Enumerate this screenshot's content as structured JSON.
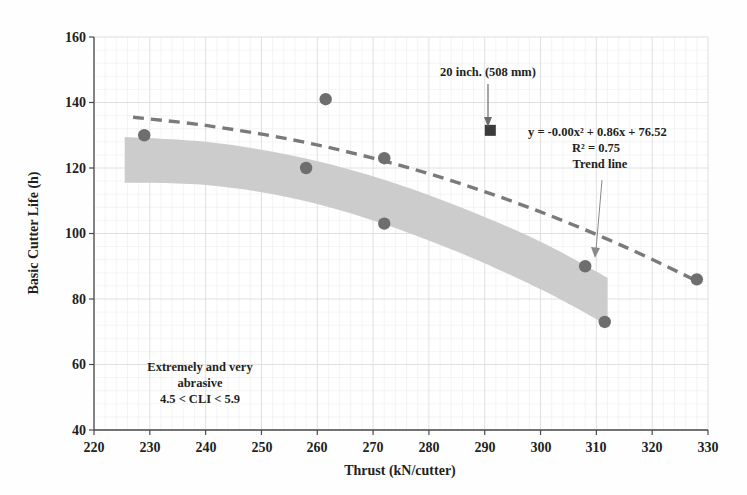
{
  "chart_data": {
    "type": "scatter",
    "title": "",
    "xlabel": "Thrust  (kN/cutter)",
    "ylabel": "Basic Cutter Life (h)",
    "xlim": [
      220,
      330
    ],
    "ylim": [
      40,
      160
    ],
    "xticks": [
      220,
      230,
      240,
      250,
      260,
      270,
      280,
      290,
      300,
      310,
      320,
      330
    ],
    "xtick_labels": [
      "220",
      "230",
      "240",
      "250",
      "260",
      "270",
      "280",
      "290",
      "300",
      "310",
      "320",
      "330"
    ],
    "yticks": [
      40,
      60,
      80,
      100,
      120,
      140,
      160
    ],
    "ytick_labels": [
      "40",
      "60",
      "80",
      "100",
      "120",
      "140",
      "160"
    ],
    "grid": true,
    "legend_position": "none",
    "series": [
      {
        "name": "Basic cutter life data",
        "marker": "circle",
        "color": "#6e6e6e",
        "points": [
          {
            "x": 229,
            "y": 130
          },
          {
            "x": 258,
            "y": 120
          },
          {
            "x": 261.5,
            "y": 141
          },
          {
            "x": 272,
            "y": 123
          },
          {
            "x": 272,
            "y": 103
          },
          {
            "x": 308,
            "y": 90
          },
          {
            "x": 311.5,
            "y": 73
          },
          {
            "x": 328,
            "y": 86
          }
        ]
      },
      {
        "name": "20 inch. (508 mm)",
        "marker": "square",
        "color": "#3b3b3b",
        "points": [
          {
            "x": 291,
            "y": 131.5
          }
        ]
      }
    ],
    "trend_line": {
      "label": "Trend line",
      "style": "dashed",
      "color": "#7a7a7a",
      "equation": "y = -0.00x² + 0.86x + 76.52",
      "r_squared": "R² = 0.75",
      "points": [
        {
          "x": 227,
          "y": 135.5
        },
        {
          "x": 240,
          "y": 133.0
        },
        {
          "x": 255,
          "y": 128.8
        },
        {
          "x": 270,
          "y": 123.0
        },
        {
          "x": 285,
          "y": 115.6
        },
        {
          "x": 300,
          "y": 106.6
        },
        {
          "x": 315,
          "y": 96.0
        },
        {
          "x": 328,
          "y": 85.5
        }
      ]
    },
    "shaded_band": {
      "name": "scatter-envelope-band",
      "color": "#c9c9c9",
      "upper": [
        {
          "x": 225.5,
          "y": 129.5
        },
        {
          "x": 240,
          "y": 128.0
        },
        {
          "x": 255,
          "y": 124.0
        },
        {
          "x": 270,
          "y": 117.5
        },
        {
          "x": 285,
          "y": 108.5
        },
        {
          "x": 300,
          "y": 97.5
        },
        {
          "x": 312,
          "y": 86.5
        }
      ],
      "lower": [
        {
          "x": 312,
          "y": 72.0
        },
        {
          "x": 300,
          "y": 83.0
        },
        {
          "x": 285,
          "y": 94.5
        },
        {
          "x": 270,
          "y": 104.0
        },
        {
          "x": 255,
          "y": 111.0
        },
        {
          "x": 240,
          "y": 114.8
        },
        {
          "x": 225.5,
          "y": 115.5
        }
      ]
    },
    "annotations": [
      {
        "name": "cutter-diameter-annotation",
        "text": "20 inch. (508 mm)",
        "arrow_from": {
          "x": 291,
          "y": 154
        },
        "arrow_to": {
          "x": 291,
          "y": 135
        }
      },
      {
        "name": "trend-line-annotation",
        "text_lines": [
          "y = -0.00x² + 0.86x + 76.52",
          "R² = 0.75",
          "Trend line"
        ],
        "leader_from": {
          "x": 312,
          "y": 117
        },
        "leader_to": {
          "x": 309,
          "y": 92
        }
      },
      {
        "name": "abrasivity-class-annotation",
        "text_lines": [
          "Extremely and very",
          "abrasive",
          "4.5 < CLI < 5.9"
        ]
      }
    ]
  },
  "labels": {
    "y_axis_title": "Basic Cutter Life (h)",
    "x_axis_title": "Thrust  (kN/cutter)",
    "callout_cutter": "20 inch. (508 mm)",
    "eq_line1": "y = -0.00x² + 0.86x + 76.52",
    "eq_line2": "R² = 0.75",
    "eq_line3": "Trend line",
    "region_line1": "Extremely and very",
    "region_line2": "abrasive",
    "region_line3": "4.5 < CLI < 5.9",
    "ytick_160": "160",
    "ytick_140": "140",
    "ytick_120": "120",
    "ytick_100": "100",
    "ytick_80": "80",
    "ytick_60": "60",
    "ytick_40": "40",
    "xtick_220": "220",
    "xtick_230": "230",
    "xtick_240": "240",
    "xtick_250": "250",
    "xtick_260": "260",
    "xtick_270": "270",
    "xtick_280": "280",
    "xtick_290": "290",
    "xtick_300": "300",
    "xtick_310": "310",
    "xtick_320": "320",
    "xtick_330": "330"
  },
  "colors": {
    "axis": "#4a4a4a",
    "grid_major": "#dcdcdc",
    "grid_minor": "#ececec",
    "marker_circle": "#6e6e6e",
    "marker_square": "#3b3b3b",
    "band": "#c9c9c9",
    "trend": "#7a7a7a",
    "text": "#231f20"
  }
}
